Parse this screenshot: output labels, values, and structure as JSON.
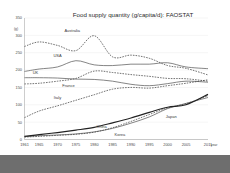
{
  "slide": {
    "background_color": "#ffffff",
    "bottom_bar_color": "#6e6e6e"
  },
  "chart_data": {
    "type": "line",
    "title": "Food supply quantity (g/capita/d): FAOSTAT",
    "xlabel": "year",
    "ylabel": "(g)",
    "ylim": [
      0,
      350
    ],
    "xlim": [
      1961,
      2011
    ],
    "grid": true,
    "legend_position": "inline-labels",
    "yticks": [
      0,
      50,
      100,
      150,
      200,
      250,
      300,
      350
    ],
    "xticks": [
      1961,
      1965,
      1970,
      1975,
      1980,
      1985,
      1990,
      1995,
      2000,
      2005,
      2011
    ],
    "x": [
      1961,
      1965,
      1970,
      1975,
      1980,
      1985,
      1990,
      1995,
      2000,
      2005,
      2011
    ],
    "series": [
      {
        "name": "Australia",
        "style": "dashed",
        "color": "#3d3d3d",
        "values": [
          268,
          281,
          271,
          256,
          299,
          238,
          243,
          234,
          213,
          205,
          186
        ],
        "label_x": 1974,
        "label_y": 310
      },
      {
        "name": "USA",
        "style": "solid",
        "color": "#555555",
        "values": [
          196,
          203,
          209,
          227,
          215,
          213,
          217,
          217,
          221,
          209,
          204
        ],
        "label_x": 1970,
        "label_y": 238
      },
      {
        "name": "UK",
        "style": "solid",
        "color": "#555555",
        "values": [
          178,
          178,
          177,
          174,
          173,
          168,
          159,
          155,
          161,
          168,
          165
        ],
        "label_x": 1964,
        "label_y": 189
      },
      {
        "name": "France",
        "style": "dashed",
        "color": "#3d3d3d",
        "values": [
          160,
          162,
          168,
          176,
          197,
          193,
          187,
          182,
          176,
          175,
          168
        ],
        "label_x": 1973,
        "label_y": 150
      },
      {
        "name": "Italy",
        "style": "dashed",
        "color": "#3d3d3d",
        "values": [
          63,
          82,
          97,
          113,
          129,
          145,
          150,
          148,
          155,
          162,
          172
        ],
        "label_x": 1970,
        "label_y": 117
      },
      {
        "name": "China",
        "style": "solid",
        "color": "#7a7a7a",
        "values": [
          8,
          11,
          13,
          16,
          22,
          32,
          47,
          65,
          89,
          104,
          121
        ],
        "label_x": 1982,
        "label_y": 34
      },
      {
        "name": "Korea",
        "style": "dashed",
        "color": "#3d3d3d",
        "values": [
          7,
          9,
          12,
          15,
          21,
          34,
          52,
          72,
          91,
          103,
          126
        ],
        "label_x": 1987,
        "label_y": 10
      },
      {
        "name": "Japan",
        "style": "thick",
        "color": "#222222",
        "values": [
          9,
          14,
          20,
          27,
          35,
          48,
          62,
          78,
          93,
          100,
          130
        ],
        "label_x": 2001,
        "label_y": 62
      }
    ]
  }
}
